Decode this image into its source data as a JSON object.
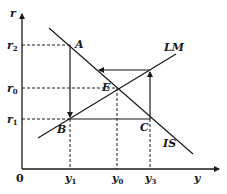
{
  "diagram": {
    "title": "",
    "axes": {
      "y_label": "r",
      "x_label": "y",
      "origin_label": "0"
    },
    "y_ticks": [
      {
        "label": "r",
        "sub": "2"
      },
      {
        "label": "r",
        "sub": "0"
      },
      {
        "label": "r",
        "sub": "1"
      }
    ],
    "x_ticks": [
      {
        "label": "y",
        "sub": "1"
      },
      {
        "label": "y",
        "sub": "0"
      },
      {
        "label": "y",
        "sub": "3"
      }
    ],
    "curves": {
      "is": "IS",
      "lm": "LM"
    },
    "points": {
      "a": "A",
      "b": "B",
      "c": "C",
      "e": "E"
    },
    "colors": {
      "line": "#1a1a1a",
      "background": "#ffffff"
    }
  }
}
